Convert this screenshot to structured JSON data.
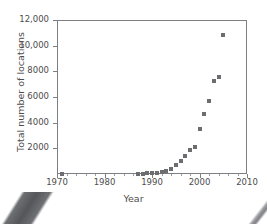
{
  "chart_data": {
    "type": "scatter",
    "title": "",
    "xlabel": "Year",
    "ylabel": "Total number of locations",
    "xlim": [
      1970,
      2010
    ],
    "ylim": [
      0,
      12000
    ],
    "grid": false,
    "legend": "none",
    "marker_style": "filled-square",
    "marker_color": "#6b6d70",
    "x_tick_labels": [
      "1970",
      "1980",
      "1990",
      "2000",
      "2010"
    ],
    "x_ticks": [
      1970,
      1980,
      1990,
      2000,
      2010
    ],
    "x_minor_tick_interval": 2,
    "y_tick_labels": [
      "2000",
      "4000",
      "6000",
      "8000",
      "10,000",
      "12,000"
    ],
    "y_ticks": [
      2000,
      4000,
      6000,
      8000,
      10000,
      12000
    ],
    "x": [
      1971,
      1987,
      1988,
      1989,
      1990,
      1991,
      1992,
      1993,
      1994,
      1995,
      1996,
      1997,
      1998,
      1999,
      2000,
      2001,
      2002,
      2003,
      2004,
      2005
    ],
    "values": [
      1,
      17,
      33,
      55,
      84,
      116,
      165,
      272,
      425,
      676,
      1015,
      1412,
      1886,
      2135,
      3501,
      4709,
      5689,
      7225,
      7569,
      10801
    ],
    "points": [
      {
        "x": 1971,
        "y": 1
      },
      {
        "x": 1987,
        "y": 17
      },
      {
        "x": 1988,
        "y": 33
      },
      {
        "x": 1989,
        "y": 55
      },
      {
        "x": 1990,
        "y": 84
      },
      {
        "x": 1991,
        "y": 116
      },
      {
        "x": 1992,
        "y": 165
      },
      {
        "x": 1993,
        "y": 272
      },
      {
        "x": 1994,
        "y": 425
      },
      {
        "x": 1995,
        "y": 676
      },
      {
        "x": 1996,
        "y": 1015
      },
      {
        "x": 1997,
        "y": 1412
      },
      {
        "x": 1998,
        "y": 1886
      },
      {
        "x": 1999,
        "y": 2135
      },
      {
        "x": 2000,
        "y": 3501
      },
      {
        "x": 2001,
        "y": 4709
      },
      {
        "x": 2002,
        "y": 5689
      },
      {
        "x": 2003,
        "y": 7225
      },
      {
        "x": 2004,
        "y": 7569
      },
      {
        "x": 2005,
        "y": 10801
      }
    ]
  },
  "colors": {
    "marker": "#6b6d70",
    "axis": "#7d7f82",
    "text": "#4c4c4c",
    "background": "#ffffff"
  }
}
